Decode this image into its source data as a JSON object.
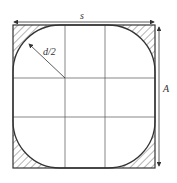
{
  "diagram": {
    "labels": {
      "width": "s",
      "radius": "d/2",
      "height": "A"
    },
    "colors": {
      "stroke": "#333333",
      "grid": "#555555",
      "hatch": "#444444"
    }
  }
}
